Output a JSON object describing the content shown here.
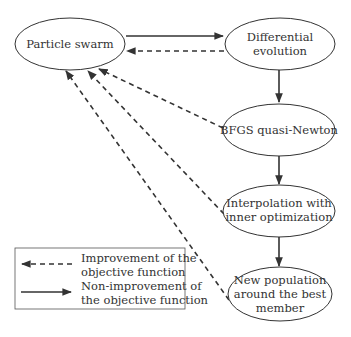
{
  "nodes": {
    "particle_swarm": {
      "lines": [
        "Particle swarm"
      ]
    },
    "differential_evolution": {
      "lines": [
        "Differential",
        "evolution"
      ]
    },
    "bfgs": {
      "lines": [
        "BFGS quasi-Newton"
      ]
    },
    "interpolation": {
      "lines": [
        "Interpolation with",
        "inner optimization"
      ]
    },
    "new_population": {
      "lines": [
        "New population",
        "around the best",
        "member"
      ]
    }
  },
  "legend": {
    "dashed_label": [
      "Improvement of the",
      "objective function"
    ],
    "solid_label": [
      "Non-improvement of",
      "the objective function"
    ]
  },
  "colors": {
    "line": "#333333",
    "background": "#ffffff"
  }
}
